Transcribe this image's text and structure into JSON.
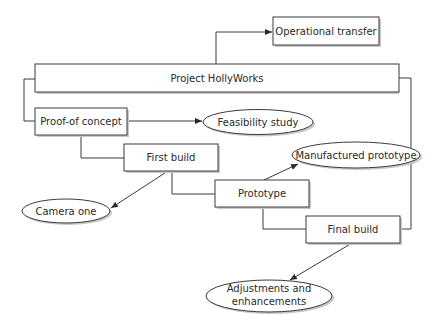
{
  "diagram": {
    "title": "Project HollyWorks",
    "nodes": {
      "operational_transfer": {
        "label": "Operational transfer",
        "shape": "rect"
      },
      "project": {
        "label": "Project HollyWorks",
        "shape": "rect"
      },
      "proof_of_concept": {
        "label": "Proof-of concept",
        "shape": "rect"
      },
      "feasibility_study": {
        "label": "Feasibility study",
        "shape": "ellipse"
      },
      "first_build": {
        "label": "First build",
        "shape": "rect"
      },
      "manufactured_prototype": {
        "label": "Manufactured prototype",
        "shape": "ellipse"
      },
      "camera_one": {
        "label": "Camera one",
        "shape": "ellipse"
      },
      "prototype": {
        "label": "Prototype",
        "shape": "rect"
      },
      "final_build": {
        "label": "Final build",
        "shape": "rect"
      },
      "adjustments": {
        "label_line1": "Adjustments and",
        "label_line2": "enhancements",
        "shape": "ellipse"
      }
    },
    "edges": [
      {
        "from": "Project HollyWorks",
        "to": "Operational transfer",
        "type": "arrow"
      },
      {
        "from": "Project HollyWorks",
        "to": "Proof-of concept",
        "type": "connector"
      },
      {
        "from": "Project HollyWorks",
        "to": "Final build",
        "type": "connector"
      },
      {
        "from": "Proof-of concept",
        "to": "Feasibility study",
        "type": "arrow"
      },
      {
        "from": "Proof-of concept",
        "to": "First build",
        "type": "connector"
      },
      {
        "from": "First build",
        "to": "Camera one",
        "type": "arrow"
      },
      {
        "from": "First build",
        "to": "Prototype",
        "type": "connector"
      },
      {
        "from": "Prototype",
        "to": "Manufactured prototype",
        "type": "arrow"
      },
      {
        "from": "Prototype",
        "to": "Final build",
        "type": "connector"
      },
      {
        "from": "Final build",
        "to": "Adjustments and enhancements",
        "type": "arrow"
      }
    ],
    "colors": {
      "stroke": "#3a3a3a",
      "fill": "#ffffff",
      "shadow": "#c8c8c8",
      "text": "#2a2a2a"
    }
  }
}
